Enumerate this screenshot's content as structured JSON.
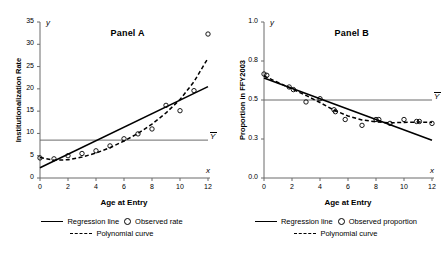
{
  "chart_data": [
    {
      "type": "scatter",
      "panel_id": "A",
      "title": "Panel A",
      "xlabel": "Age at Entry",
      "ylabel": "Institutionalization Rate",
      "x_axis_symbol": "x",
      "y_axis_symbol": "y",
      "xlim": [
        0,
        12
      ],
      "ylim": [
        0,
        35
      ],
      "xticks": [
        0,
        2,
        4,
        6,
        8,
        10,
        12
      ],
      "xticklabels": [
        "0",
        "2",
        "4",
        "6",
        "8",
        "10",
        "12"
      ],
      "yticks": [
        0,
        5,
        10,
        15,
        20,
        25,
        30,
        35
      ],
      "yticklabels": [
        "0",
        "5",
        "10",
        "15",
        "20",
        "25",
        "30",
        "35"
      ],
      "grid": false,
      "legend_position": "below",
      "mean_line": {
        "label": "Y",
        "value": 8.5
      },
      "series": [
        {
          "name": "Observed rate",
          "type": "scatter",
          "x": [
            0,
            1,
            2,
            3,
            4,
            5,
            6,
            7,
            8,
            9,
            10,
            11,
            12
          ],
          "y": [
            4.5,
            4.3,
            5.0,
            5.5,
            6.1,
            7.2,
            8.8,
            9.9,
            11.0,
            16.3,
            15.1,
            19.6,
            32.3
          ]
        },
        {
          "name": "Regression line",
          "type": "line",
          "x": [
            0,
            12
          ],
          "y": [
            2.3,
            20.5
          ]
        },
        {
          "name": "Polynomial curve",
          "type": "line",
          "x": [
            0,
            1,
            2,
            3,
            4,
            5,
            6,
            7,
            8,
            9,
            10,
            11,
            12
          ],
          "y": [
            4.6,
            4.0,
            4.1,
            4.7,
            5.6,
            6.8,
            8.3,
            10.0,
            12.1,
            14.6,
            17.6,
            21.6,
            26.9
          ]
        }
      ],
      "legend": [
        {
          "key": "regression-line",
          "label": "Regression line",
          "marker": "solid-line"
        },
        {
          "key": "observed-rate",
          "label": "Observed rate",
          "marker": "circle"
        },
        {
          "key": "polynomial-curve",
          "label": "Polynomial curve",
          "marker": "dashed-line"
        }
      ]
    },
    {
      "type": "scatter",
      "panel_id": "B",
      "title": "Panel B",
      "xlabel": "Age at Entry",
      "ylabel": "Proportion in FFY2003",
      "x_axis_symbol": "x",
      "y_axis_symbol": "y",
      "xlim": [
        0,
        12
      ],
      "ylim": [
        0.0,
        1.0
      ],
      "xticks": [
        0,
        2,
        4,
        6,
        8,
        10,
        12
      ],
      "xticklabels": [
        "0",
        "2",
        "4",
        "6",
        "8",
        "10",
        "12"
      ],
      "yticks": [
        0.0,
        0.3,
        0.5,
        0.8,
        1.0
      ],
      "yticklabels": [
        "0.0",
        "0.3",
        "0.5",
        "0.8",
        "1.0"
      ],
      "grid": false,
      "legend_position": "below",
      "mean_line": {
        "label": "Y",
        "value": 0.5
      },
      "series": [
        {
          "name": "Observed proportion",
          "type": "scatter",
          "x": [
            0,
            0.2,
            1.8,
            2.1,
            3.0,
            4.0,
            5.0,
            5.1,
            5.8,
            7.0,
            8.0,
            8.2,
            9.0,
            10.0,
            10.9,
            11.1,
            12.0
          ],
          "y": [
            0.7,
            0.69,
            0.6,
            0.58,
            0.49,
            0.51,
            0.45,
            0.44,
            0.4,
            0.37,
            0.4,
            0.4,
            0.38,
            0.4,
            0.39,
            0.39,
            0.38
          ]
        },
        {
          "name": "Regression line",
          "type": "line",
          "x": [
            0,
            12
          ],
          "y": [
            0.67,
            0.29
          ]
        },
        {
          "name": "Polynomial curve",
          "type": "line",
          "x": [
            0,
            1,
            2,
            3,
            4,
            5,
            6,
            7,
            8,
            9,
            10,
            11,
            12
          ],
          "y": [
            0.685,
            0.635,
            0.585,
            0.535,
            0.487,
            0.448,
            0.418,
            0.398,
            0.388,
            0.383,
            0.385,
            0.387,
            0.385
          ]
        }
      ],
      "legend": [
        {
          "key": "regression-line",
          "label": "Regression line",
          "marker": "solid-line"
        },
        {
          "key": "observed-proportion",
          "label": "Observed proportion",
          "marker": "circle"
        },
        {
          "key": "polynomial-curve",
          "label": "Polynomial curve",
          "marker": "dashed-line"
        }
      ]
    }
  ],
  "colors": {
    "ink": "#000000",
    "axis": "#6b6b6b",
    "background": "#ffffff"
  }
}
